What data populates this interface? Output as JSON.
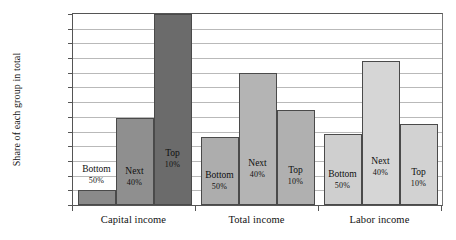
{
  "chart_data": {
    "type": "bar",
    "title": "",
    "subtitle": "",
    "xlabel": "",
    "ylabel": "Share of each group in total",
    "categories": [
      "Capital income",
      "Total income",
      "Labor income"
    ],
    "ylim": [
      0,
      65
    ],
    "ytick_step": 5,
    "ytick_labels": [
      "0%",
      "5%",
      "10%",
      "15%",
      "20%",
      "25%",
      "30%",
      "35%",
      "40%",
      "45%",
      "50%",
      "55%",
      "60%",
      "65%"
    ],
    "ytick_values": [
      0,
      5,
      10,
      15,
      20,
      25,
      30,
      35,
      40,
      45,
      50,
      55,
      60,
      65
    ],
    "grid": true,
    "legend": "none",
    "series": [
      {
        "name": "Bottom 50%",
        "label_line1": "Bottom",
        "label_line2": "50%",
        "color": "#8c8c8c",
        "values": [
          5,
          23,
          24
        ]
      },
      {
        "name": "Next 40%",
        "label_line1": "Next",
        "label_line2": "40%",
        "color": "#9a9a9a",
        "values": [
          29.5,
          45,
          49
        ]
      },
      {
        "name": "Top 10%",
        "label_line1": "Top",
        "label_line2": "10%",
        "color": "#6e6e6e",
        "values": [
          65,
          32.5,
          27.5
        ]
      }
    ],
    "bar_colors_by_group": [
      [
        "#8a8a8a",
        "#8f8f8f",
        "#6b6b6b"
      ],
      [
        "#adadad",
        "#b4b4b4",
        "#b0b0b0"
      ],
      [
        "#cfcfcf",
        "#d6d6d6",
        "#d2d2d2"
      ]
    ],
    "bar_labels": [
      [
        {
          "line1": "Bottom",
          "line2": "50%",
          "placement": "above"
        },
        {
          "line1": "Next",
          "line2": "40%",
          "placement": "inside"
        },
        {
          "line1": "Top",
          "line2": "10%",
          "placement": "inside"
        }
      ],
      [
        {
          "line1": "Bottom",
          "line2": "50%",
          "placement": "inside"
        },
        {
          "line1": "Next",
          "line2": "40%",
          "placement": "inside"
        },
        {
          "line1": "Top",
          "line2": "10%",
          "placement": "inside"
        }
      ],
      [
        {
          "line1": "Bottom",
          "line2": "50%",
          "placement": "inside"
        },
        {
          "line1": "Next",
          "line2": "40%",
          "placement": "inside"
        },
        {
          "line1": "Top",
          "line2": "10%",
          "placement": "inside"
        }
      ]
    ],
    "axis_color": "#555555",
    "grid_color": "#b9b9b9",
    "background": "#ffffff"
  }
}
